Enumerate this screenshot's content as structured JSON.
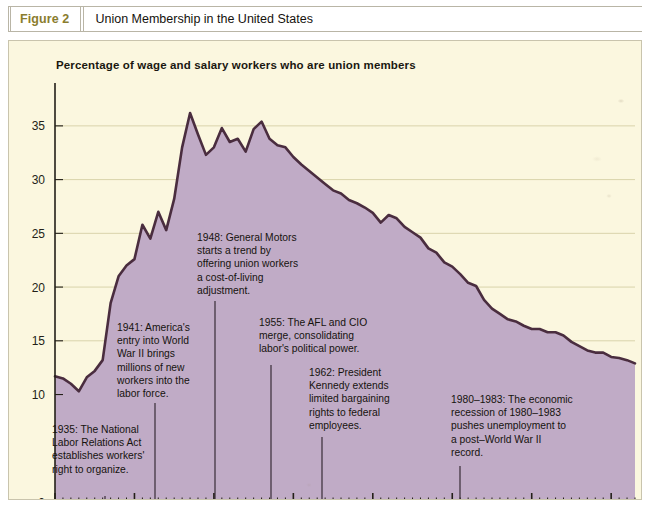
{
  "figure": {
    "label": "Figure 2",
    "title": "Union Membership in the United States",
    "label_color": "#8a7d2e"
  },
  "colors": {
    "panel_background": "#fbf7df",
    "area_fill": "#c0abc6",
    "line_stroke": "#4a2d3f",
    "gridline": "#d9d3ab",
    "axis": "#231f18",
    "figure_label": "#8a7d2e"
  },
  "chart_data": {
    "type": "area",
    "title": "Percentage of wage and salary workers who are union members",
    "xlabel": "",
    "ylabel": "",
    "xlim": [
      1930,
      2003
    ],
    "ylim": [
      0,
      37.5
    ],
    "grid": true,
    "legend": "none",
    "ytick_labels": [
      "0",
      "10",
      "15",
      "20",
      "25",
      "30",
      "35"
    ],
    "ytick_values": [
      0,
      10,
      15,
      20,
      25,
      30,
      35
    ],
    "xtick_labels": [
      "1930",
      "1940",
      "1950",
      "1960",
      "1970",
      "1980",
      "1990",
      "2000"
    ],
    "xtick_values": [
      1930,
      1940,
      1950,
      1960,
      1970,
      1980,
      1990,
      2000
    ],
    "minor_xtick_interval": 1,
    "x": [
      1930,
      1931,
      1932,
      1933,
      1934,
      1935,
      1936,
      1937,
      1938,
      1939,
      1940,
      1941,
      1942,
      1943,
      1944,
      1945,
      1946,
      1947,
      1948,
      1949,
      1950,
      1951,
      1952,
      1953,
      1954,
      1955,
      1956,
      1957,
      1958,
      1959,
      1960,
      1961,
      1962,
      1963,
      1964,
      1965,
      1966,
      1967,
      1968,
      1969,
      1970,
      1971,
      1972,
      1973,
      1974,
      1975,
      1976,
      1977,
      1978,
      1979,
      1980,
      1981,
      1982,
      1983,
      1984,
      1985,
      1986,
      1987,
      1988,
      1989,
      1990,
      1991,
      1992,
      1993,
      1994,
      1995,
      1996,
      1997,
      1998,
      1999,
      2000,
      2001,
      2002,
      2003
    ],
    "values": [
      11.7,
      11.5,
      11.0,
      10.3,
      11.6,
      12.2,
      13.2,
      18.5,
      21.0,
      22.0,
      22.6,
      25.8,
      24.5,
      27.0,
      25.3,
      28.2,
      33.0,
      36.2,
      34.2,
      32.3,
      33.0,
      34.8,
      33.5,
      33.8,
      32.6,
      34.7,
      35.4,
      33.8,
      33.2,
      33.0,
      32.1,
      31.4,
      30.8,
      30.2,
      29.6,
      29.0,
      28.7,
      28.1,
      27.8,
      27.4,
      26.9,
      26.0,
      26.7,
      26.4,
      25.6,
      25.1,
      24.6,
      23.6,
      23.2,
      22.3,
      21.9,
      21.2,
      20.4,
      20.1,
      18.8,
      18.0,
      17.5,
      17.0,
      16.8,
      16.4,
      16.1,
      16.1,
      15.8,
      15.8,
      15.5,
      14.9,
      14.5,
      14.1,
      13.9,
      13.9,
      13.5,
      13.4,
      13.2,
      12.9
    ]
  },
  "annotations": [
    {
      "id": "annotation-1935",
      "year": 1935,
      "lines": [
        "1935: The National",
        "Labor Relations Act",
        "establishes workers'",
        "right to organize."
      ],
      "text_x": 43,
      "text_y": 392,
      "leader_x": 96,
      "leader_y1": 455,
      "leader_y2": 461
    },
    {
      "id": "annotation-1941",
      "year": 1941,
      "lines": [
        "1941: America's",
        "entry into World",
        "War II brings",
        "millions of new",
        "workers into the",
        "labor force."
      ],
      "text_x": 108,
      "text_y": 290,
      "leader_x": 146,
      "leader_y1": 362,
      "leader_y2": 461
    },
    {
      "id": "annotation-1948",
      "year": 1948,
      "lines": [
        "1948: General Motors",
        "starts a trend by",
        "offering union workers",
        "a cost-of-living",
        "adjustment."
      ],
      "text_x": 188,
      "text_y": 200,
      "leader_x": 206,
      "leader_y1": 260,
      "leader_y2": 461
    },
    {
      "id": "annotation-1955",
      "year": 1955,
      "lines": [
        "1955: The AFL and CIO",
        "merge, consolidating",
        "labor's political power."
      ],
      "text_x": 250,
      "text_y": 285,
      "leader_x": 262,
      "leader_y1": 324,
      "leader_y2": 461
    },
    {
      "id": "annotation-1962",
      "year": 1962,
      "lines": [
        "1962: President",
        "Kennedy extends",
        "limited bargaining",
        "rights to federal",
        "employees."
      ],
      "text_x": 300,
      "text_y": 335,
      "leader_x": 313,
      "leader_y1": 396,
      "leader_y2": 461
    },
    {
      "id": "annotation-1980-1983",
      "year": 1980,
      "lines": [
        "1980–1983: The economic",
        "recession of 1980–1983",
        "pushes unemployment to",
        "a post–World War II",
        "record."
      ],
      "text_x": 442,
      "text_y": 362,
      "leader_x": 451,
      "leader_y1": 425,
      "leader_y2": 461
    }
  ]
}
